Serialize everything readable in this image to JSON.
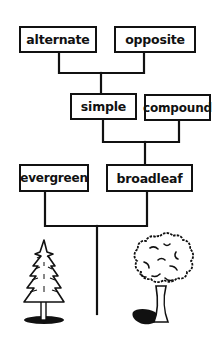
{
  "diagram": {
    "type": "dichotomous-key-tree",
    "nodes": [
      {
        "id": "alternate",
        "label": "alternate",
        "level": 1
      },
      {
        "id": "opposite",
        "label": "opposite",
        "level": 1
      },
      {
        "id": "simple",
        "label": "simple",
        "level": 2
      },
      {
        "id": "compound",
        "label": "compound",
        "level": 2
      },
      {
        "id": "evergreen",
        "label": "evergreen",
        "level": 3
      },
      {
        "id": "broadleaf",
        "label": "broadleaf",
        "level": 3
      }
    ],
    "edges": [
      {
        "from": [
          "alternate",
          "opposite"
        ],
        "to": "simple"
      },
      {
        "from": [
          "simple",
          "compound"
        ],
        "to": "broadleaf"
      },
      {
        "from": [
          "evergreen",
          "broadleaf"
        ],
        "to": "root"
      }
    ],
    "illustrations": [
      {
        "name": "evergreen-tree",
        "position": "bottom-left"
      },
      {
        "name": "broadleaf-tree",
        "position": "bottom-right"
      }
    ],
    "colors": {
      "line": "#111111",
      "background": "#ffffff"
    }
  }
}
